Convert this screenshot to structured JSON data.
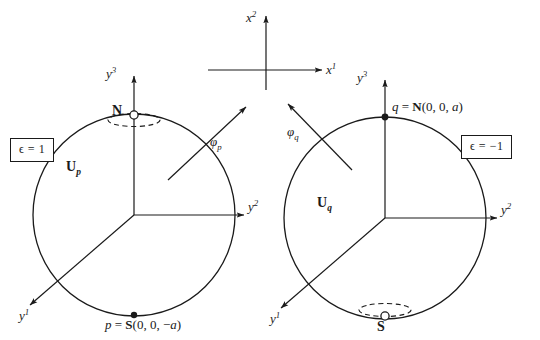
{
  "figure": {
    "background_color": "#ffffff",
    "stroke_color": "#1a1a1a"
  },
  "center_axes": {
    "name": "projection-plane-axes",
    "vertical_axis_label": "x",
    "vertical_axis_superscript": "2",
    "horizontal_axis_label": "x",
    "horizontal_axis_superscript": "1"
  },
  "left_chart": {
    "epsilon_box": "ϵ = 1",
    "chart_label": "U",
    "chart_label_sub": "p",
    "axis_y1": "y",
    "axis_y1_sup": "1",
    "axis_y2": "y",
    "axis_y2_sup": "2",
    "axis_y3": "y",
    "axis_y3_sup": "3",
    "pole_label": "N",
    "pole_marker": "open-circle",
    "point_label": "p = S(0, 0, −a)",
    "point_marker": "filled-dot",
    "map_label": "φ",
    "map_label_sub": "p"
  },
  "right_chart": {
    "epsilon_box": "ϵ = −1",
    "chart_label": "U",
    "chart_label_sub": "q",
    "axis_y1": "y",
    "axis_y1_sup": "1",
    "axis_y2": "y",
    "axis_y2_sup": "2",
    "axis_y3": "y",
    "axis_y3_sup": "3",
    "pole_label": "S",
    "pole_marker": "open-circle",
    "point_label": "q = N(0, 0, a)",
    "point_marker": "filled-dot",
    "map_label": "φ",
    "map_label_sub": "q"
  }
}
